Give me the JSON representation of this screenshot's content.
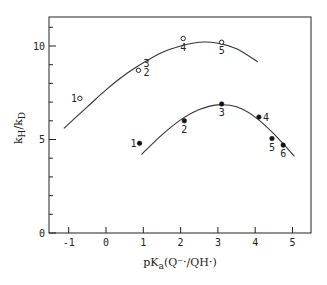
{
  "chart_data": {
    "type": "scatter",
    "title": "",
    "xlabel": "pKa(Q⁻·/QH·)",
    "xlabel_parts": {
      "main": "pK",
      "sub": "a",
      "rest": "(Q⁻·/QH·)"
    },
    "ylabel": "kH/kD",
    "ylabel_parts": {
      "k1": "k",
      "sub1": "H",
      "slash": "/",
      "k2": "k",
      "sub2": "D"
    },
    "xlim": [
      -1.5,
      5.5
    ],
    "ylim": [
      0,
      11.5
    ],
    "x_ticks": [
      -1,
      0,
      1,
      2,
      3,
      4,
      5
    ],
    "x_tick_labels": [
      "-1",
      "0",
      "1",
      "2",
      "3",
      "4",
      "5"
    ],
    "y_ticks": [
      0,
      5,
      10
    ],
    "y_tick_labels": [
      "0",
      "5",
      "10"
    ],
    "y_minor_ticks": [
      1,
      2,
      3,
      4,
      6,
      7,
      8,
      9,
      11
    ],
    "grid": false,
    "legend": null,
    "series": [
      {
        "name": "open circles",
        "marker": "open-circle",
        "points": [
          {
            "label": "1",
            "x": -0.7,
            "y": 7.2
          },
          {
            "label": "2",
            "x": 0.87,
            "y": 8.6
          },
          {
            "label": "3",
            "x": 0.87,
            "y": 8.8
          },
          {
            "label": "4",
            "x": 2.07,
            "y": 10.4
          },
          {
            "label": "5",
            "x": 3.1,
            "y": 10.2
          }
        ],
        "fit_curve": [
          [
            -1.13,
            5.6
          ],
          [
            -0.5,
            6.75
          ],
          [
            0.0,
            7.65
          ],
          [
            0.5,
            8.45
          ],
          [
            1.0,
            9.1
          ],
          [
            1.5,
            9.65
          ],
          [
            2.0,
            10.0
          ],
          [
            2.5,
            10.2
          ],
          [
            3.0,
            10.15
          ],
          [
            3.5,
            9.85
          ],
          [
            4.07,
            9.15
          ]
        ]
      },
      {
        "name": "filled circles",
        "marker": "filled-circle",
        "points": [
          {
            "label": "1",
            "x": 0.9,
            "y": 4.8
          },
          {
            "label": "2",
            "x": 2.1,
            "y": 6.0
          },
          {
            "label": "3",
            "x": 3.1,
            "y": 6.9
          },
          {
            "label": "4",
            "x": 4.1,
            "y": 6.2
          },
          {
            "label": "5",
            "x": 4.45,
            "y": 5.05
          },
          {
            "label": "6",
            "x": 4.75,
            "y": 4.7
          }
        ],
        "fit_curve": [
          [
            0.95,
            4.2
          ],
          [
            1.5,
            5.25
          ],
          [
            2.0,
            6.05
          ],
          [
            2.5,
            6.6
          ],
          [
            3.0,
            6.85
          ],
          [
            3.5,
            6.75
          ],
          [
            4.0,
            6.2
          ],
          [
            4.5,
            5.3
          ],
          [
            5.05,
            4.1
          ]
        ]
      }
    ]
  },
  "layout": {
    "plot_left": 49,
    "plot_top": 17,
    "plot_right": 311,
    "plot_bottom": 233,
    "x0_px": 106,
    "x_unit_px": 37.3,
    "y0_px": 233,
    "y_unit_px": 18.7,
    "color": "#222222"
  },
  "labels": {
    "open": [
      {
        "text": "1",
        "dx": -9,
        "dy": 4
      },
      {
        "text": "2",
        "dx": 5,
        "dy": 6
      },
      {
        "text": "3",
        "dx": 5,
        "dy": -3
      },
      {
        "text": "4",
        "dx": -3,
        "dy": 12
      },
      {
        "text": "5",
        "dx": -3,
        "dy": 12
      }
    ],
    "filled": [
      {
        "text": "1",
        "dx": -9,
        "dy": 4
      },
      {
        "text": "2",
        "dx": -3,
        "dy": 12
      },
      {
        "text": "3",
        "dx": -3,
        "dy": 12
      },
      {
        "text": "4",
        "dx": 4,
        "dy": 4
      },
      {
        "text": "5",
        "dx": -3,
        "dy": 12
      },
      {
        "text": "6",
        "dx": -3,
        "dy": 12
      }
    ]
  }
}
